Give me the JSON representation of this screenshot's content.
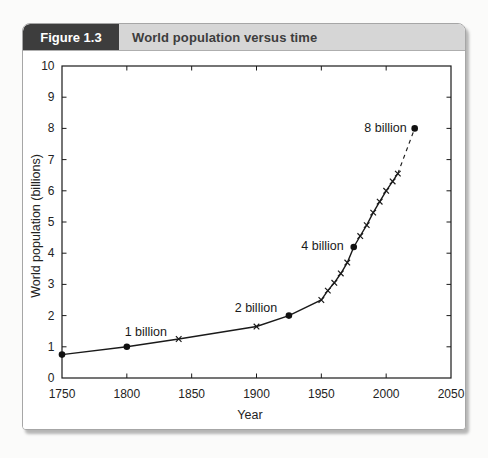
{
  "header": {
    "figure_label": "Figure 1.3",
    "figure_title": "World population versus time"
  },
  "colors": {
    "header_box_bg": "#3d3d3d",
    "header_box_text": "#ffffff",
    "header_bar_bg": "#d6d6d6",
    "header_bar_text": "#3d3d3d",
    "panel_bg": "#ffffff",
    "panel_border": "#a6a6a6",
    "line": "#1a1a1a",
    "text": "#232323"
  },
  "chart_data": {
    "type": "line",
    "title": "World population versus time",
    "xlabel": "Year",
    "ylabel": "World population (billions)",
    "xlim": [
      1750,
      2050
    ],
    "ylim": [
      0,
      10
    ],
    "x_ticks": [
      1750,
      1800,
      1850,
      1900,
      1950,
      2000,
      2050
    ],
    "y_ticks": [
      0,
      1,
      2,
      3,
      4,
      5,
      6,
      7,
      8,
      9,
      10
    ],
    "grid": false,
    "legend": null,
    "series": [
      {
        "name": "World population (historical, solid line)",
        "style": "solid",
        "points": [
          {
            "year": 1750,
            "population": 0.75,
            "marker": "circle"
          },
          {
            "year": 1800,
            "population": 1.0,
            "marker": "circle",
            "annotation": "1 billion"
          },
          {
            "year": 1840,
            "population": 1.25,
            "marker": "x"
          },
          {
            "year": 1900,
            "population": 1.65,
            "marker": "x"
          },
          {
            "year": 1925,
            "population": 2.0,
            "marker": "circle",
            "annotation": "2 billion"
          },
          {
            "year": 1950,
            "population": 2.5,
            "marker": "x"
          },
          {
            "year": 1955,
            "population": 2.8,
            "marker": "x"
          },
          {
            "year": 1960,
            "population": 3.05,
            "marker": "x"
          },
          {
            "year": 1965,
            "population": 3.35,
            "marker": "x"
          },
          {
            "year": 1970,
            "population": 3.7,
            "marker": "x"
          },
          {
            "year": 1975,
            "population": 4.2,
            "marker": "circle",
            "annotation": "4 billion"
          },
          {
            "year": 1980,
            "population": 4.55,
            "marker": "x"
          },
          {
            "year": 1985,
            "population": 4.9,
            "marker": "x"
          },
          {
            "year": 1990,
            "population": 5.3,
            "marker": "x"
          },
          {
            "year": 1995,
            "population": 5.65,
            "marker": "x"
          },
          {
            "year": 2000,
            "population": 6.0,
            "marker": "x"
          },
          {
            "year": 2005,
            "population": 6.3,
            "marker": "x"
          },
          {
            "year": 2009,
            "population": 6.55,
            "marker": "x"
          }
        ]
      },
      {
        "name": "Projection (dashed line)",
        "style": "dashed",
        "points": [
          {
            "year": 2009,
            "population": 6.55
          },
          {
            "year": 2022,
            "population": 8.0,
            "marker": "circle",
            "annotation": "8 billion"
          }
        ]
      }
    ]
  }
}
